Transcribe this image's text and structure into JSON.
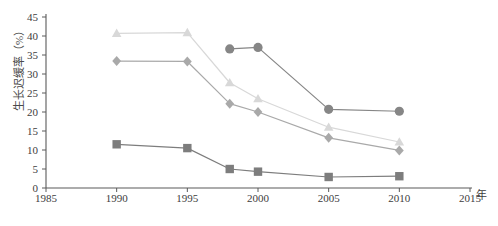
{
  "chart_data": {
    "type": "line",
    "title": "",
    "xlabel": "年",
    "ylabel": "生长迟缓率（%）",
    "xlim": [
      1985,
      2015
    ],
    "ylim": [
      0,
      45
    ],
    "xticks": [
      1985,
      1990,
      1995,
      2000,
      2005,
      2010,
      2015
    ],
    "yticks": [
      0,
      5,
      10,
      15,
      20,
      25,
      30,
      35,
      40,
      45
    ],
    "grid": false,
    "legend": "none",
    "series": [
      {
        "name": "series-circle",
        "marker": "circle",
        "color": "#868686",
        "points": [
          {
            "x": 1998,
            "y": 36.6
          },
          {
            "x": 2000,
            "y": 37.0
          },
          {
            "x": 2005,
            "y": 20.7
          },
          {
            "x": 2010,
            "y": 20.2
          }
        ]
      },
      {
        "name": "series-triangle",
        "marker": "triangle",
        "color": "#d8d8d8",
        "points": [
          {
            "x": 1990,
            "y": 40.7
          },
          {
            "x": 1995,
            "y": 40.9
          },
          {
            "x": 1998,
            "y": 27.7
          },
          {
            "x": 2000,
            "y": 23.5
          },
          {
            "x": 2005,
            "y": 16.0
          },
          {
            "x": 2010,
            "y": 12.1
          }
        ]
      },
      {
        "name": "series-diamond",
        "marker": "diamond",
        "color": "#a9a9a9",
        "points": [
          {
            "x": 1990,
            "y": 33.4
          },
          {
            "x": 1995,
            "y": 33.3
          },
          {
            "x": 1998,
            "y": 22.2
          },
          {
            "x": 2000,
            "y": 20.0
          },
          {
            "x": 2005,
            "y": 13.2
          },
          {
            "x": 2010,
            "y": 9.9
          }
        ]
      },
      {
        "name": "series-square",
        "marker": "square",
        "color": "#7d7d7d",
        "points": [
          {
            "x": 1990,
            "y": 11.5
          },
          {
            "x": 1995,
            "y": 10.5
          },
          {
            "x": 1998,
            "y": 5.0
          },
          {
            "x": 2000,
            "y": 4.3
          },
          {
            "x": 2005,
            "y": 2.9
          },
          {
            "x": 2010,
            "y": 3.1
          }
        ]
      }
    ]
  },
  "axis": {
    "x_unit_label": "年",
    "y_axis_title": "生长迟缓率（%）"
  }
}
